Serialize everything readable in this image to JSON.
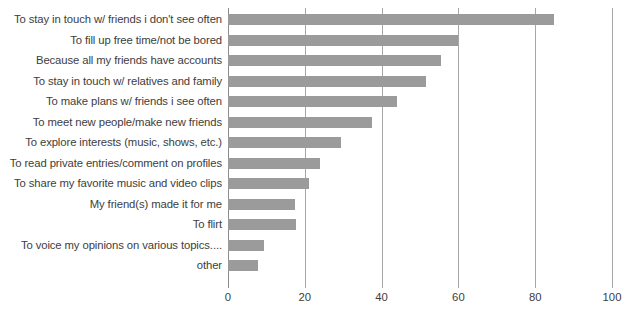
{
  "chart_data": {
    "type": "bar",
    "orientation": "horizontal",
    "title": "",
    "subtitle": "",
    "xlabel": "",
    "ylabel": "",
    "xlim": [
      0,
      100
    ],
    "xticks": [
      0,
      20,
      40,
      60,
      80,
      100
    ],
    "xtick_labels": [
      "0",
      "20",
      "40",
      "60",
      "80",
      "100"
    ],
    "grid": true,
    "grid_axis": "x",
    "legend": false,
    "legend_position": "none",
    "bar_color": "#9b9b9b",
    "grid_color": "#a6a6a6",
    "text_color": "#3d3d3d",
    "background": "#ffffff",
    "categories": [
      "To stay in touch w/ friends i don't see often",
      "To fill up free time/not be bored",
      "Because all my friends have accounts",
      "To stay in touch w/ relatives and family",
      "To make plans w/ friends i see often",
      "To meet new people/make new friends",
      "To explore interests (music, shows, etc.)",
      "To read private entries/comment on profiles",
      "To share my favorite music and video clips",
      "My friend(s) made it for me",
      "To flirt",
      "To voice my opinions on various topics....",
      "other"
    ],
    "values": [
      85,
      60,
      55.5,
      51.5,
      44,
      37.5,
      29.5,
      24,
      21,
      17.5,
      17.7,
      9.5,
      7.8
    ]
  }
}
